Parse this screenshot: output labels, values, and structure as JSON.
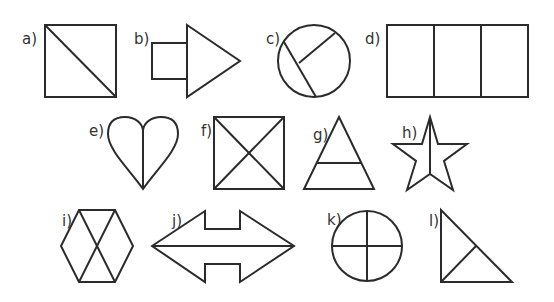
{
  "colors": {
    "background": "#ffffff",
    "stroke": "#2b2b2b",
    "label": "#333333"
  },
  "shapes": [
    {
      "label": "a)",
      "description": "square divided by one diagonal"
    },
    {
      "label": "b)",
      "description": "small square attached to a triangle (arrow)"
    },
    {
      "label": "c)",
      "description": "circle with a chord and a radius"
    },
    {
      "label": "d)",
      "description": "rectangle divided into three equal parts"
    },
    {
      "label": "e)",
      "description": "heart divided by a vertical line"
    },
    {
      "label": "f)",
      "description": "square divided by both diagonals"
    },
    {
      "label": "g)",
      "description": "triangle with a horizontal line"
    },
    {
      "label": "h)",
      "description": "star divided by a vertical line"
    },
    {
      "label": "i)",
      "description": "hexagon with two crossing diagonals"
    },
    {
      "label": "j)",
      "description": "double-headed arrow divided horizontally"
    },
    {
      "label": "k)",
      "description": "circle divided into quarters"
    },
    {
      "label": "l)",
      "description": "right triangle with a line from the right angle to the hypotenuse"
    }
  ]
}
